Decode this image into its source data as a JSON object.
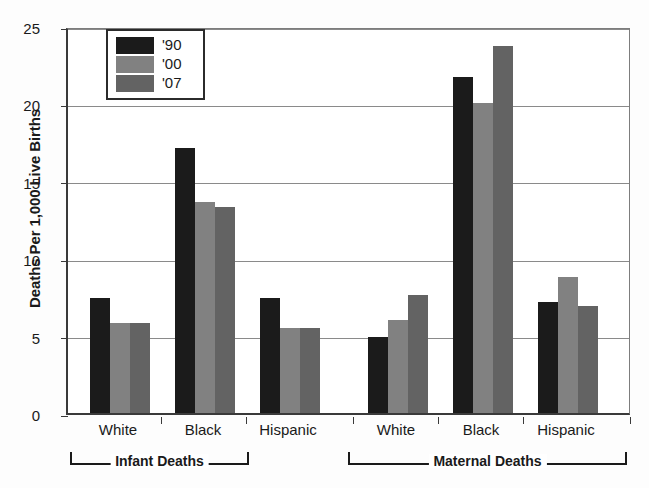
{
  "chart_data": {
    "type": "bar",
    "title": "",
    "xlabel": "",
    "ylabel": "Deaths Per 1,000 Live Births",
    "ylim": [
      0,
      25
    ],
    "yticks": [
      0,
      5,
      10,
      15,
      20,
      25
    ],
    "ytick_labels": [
      "0",
      "5",
      "10",
      "15",
      "20",
      "25"
    ],
    "grid": true,
    "legend_position": "upper left",
    "categories": [
      "White",
      "Black",
      "Hispanic",
      "White",
      "Black",
      "Hispanic"
    ],
    "group_brackets": [
      {
        "label": "Infant Deaths",
        "categories": [
          "White",
          "Black",
          "Hispanic"
        ]
      },
      {
        "label": "Maternal Deaths",
        "categories": [
          "White",
          "Black",
          "Hispanic"
        ]
      }
    ],
    "series": [
      {
        "name": "'90",
        "color": "#1b1b1b",
        "values": [
          7.4,
          17.1,
          7.4,
          4.9,
          21.7,
          7.2
        ]
      },
      {
        "name": "'00",
        "color": "#818181",
        "values": [
          5.8,
          13.6,
          5.5,
          6.0,
          20.0,
          8.8
        ]
      },
      {
        "name": "'07",
        "color": "#636363",
        "values": [
          5.8,
          13.3,
          5.5,
          7.6,
          23.7,
          6.9
        ]
      }
    ]
  },
  "legend": {
    "items": [
      {
        "label": "'90",
        "color": "#1b1b1b"
      },
      {
        "label": "'00",
        "color": "#818181"
      },
      {
        "label": "'07",
        "color": "#636363"
      }
    ]
  },
  "axes": {
    "y_title": "Deaths Per 1,000 Live Births",
    "y_tick_labels": [
      "25",
      "20",
      "15",
      "10",
      "5",
      "0"
    ],
    "x_tick_labels": [
      "White",
      "Black",
      "Hispanic",
      "White",
      "Black",
      "Hispanic"
    ]
  },
  "brackets": [
    {
      "label": "Infant Deaths"
    },
    {
      "label": "Maternal Deaths"
    }
  ]
}
